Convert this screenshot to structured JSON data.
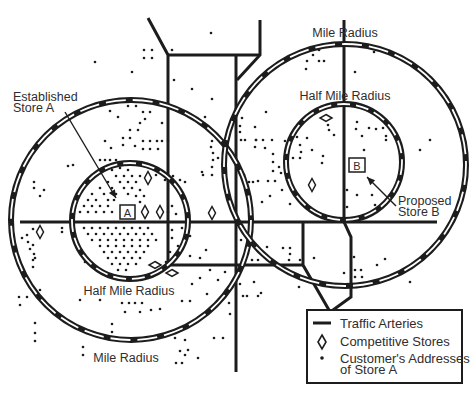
{
  "diagram": {
    "colors": {
      "ink": "#1c1c1c",
      "paper": "#ffffff",
      "text": "#2e2e2e"
    },
    "labels": {
      "mile_radius_top": "Mile Radius",
      "half_mile_radius_top": "Half Mile Radius",
      "established_line1": "Established",
      "established_line2": "Store A",
      "proposed_line1": "Proposed",
      "proposed_line2": "Store B",
      "half_mile_radius_bottom": "Half Mile Radius",
      "mile_radius_bottom": "Mile Radius",
      "store_a": "A",
      "store_b": "B"
    },
    "legend": {
      "traffic_arteries": "Traffic Arteries",
      "competitive_stores": "Competitive Stores",
      "customer_addresses_line1": "Customer's Addresses",
      "customer_addresses_line2": "of Store A"
    },
    "rings": [
      {
        "name": "store-a-mile-ring",
        "cx": 131,
        "cy": 220,
        "r": 120,
        "dash": "20 7"
      },
      {
        "name": "store-a-half-mile-ring",
        "cx": 130,
        "cy": 221,
        "r": 58,
        "dash": "13 6"
      },
      {
        "name": "store-b-mile-ring",
        "cx": 345,
        "cy": 165,
        "r": 121,
        "dash": "20 7"
      },
      {
        "name": "store-b-half-mile-ring",
        "cx": 344,
        "cy": 162,
        "r": 58,
        "dash": "13 6"
      }
    ],
    "roads": [
      [
        [
          148,
          18
        ],
        [
          168,
          55
        ],
        [
          168,
          265
        ]
      ],
      [
        [
          168,
          55
        ],
        [
          260,
          55
        ]
      ],
      [
        [
          260,
          20
        ],
        [
          260,
          55
        ],
        [
          237,
          80
        ]
      ],
      [
        [
          236,
          55
        ],
        [
          236,
          372
        ]
      ],
      [
        [
          344,
          20
        ],
        [
          344,
          222
        ],
        [
          351,
          237
        ],
        [
          351,
          297
        ],
        [
          333,
          310
        ]
      ],
      [
        [
          20,
          222
        ],
        [
          437,
          222
        ]
      ],
      [
        [
          168,
          265
        ],
        [
          303,
          265
        ]
      ],
      [
        [
          303,
          222
        ],
        [
          303,
          265
        ],
        [
          329,
          310
        ]
      ]
    ],
    "stores": [
      {
        "id": "A",
        "x": 120,
        "y": 205,
        "w": 15,
        "h": 14
      },
      {
        "id": "B",
        "x": 349,
        "y": 158,
        "w": 16,
        "h": 14
      }
    ],
    "arrows": [
      {
        "name": "store-a-arrow",
        "from": [
          65,
          112
        ],
        "to": [
          116,
          198
        ]
      },
      {
        "name": "store-b-arrow",
        "from": [
          396,
          206
        ],
        "to": [
          367,
          177
        ]
      }
    ],
    "competitive_stores": [
      {
        "x": 148,
        "y": 178,
        "orient": "v"
      },
      {
        "x": 145,
        "y": 212,
        "orient": "v"
      },
      {
        "x": 160,
        "y": 212,
        "orient": "v"
      },
      {
        "x": 40,
        "y": 232,
        "orient": "v"
      },
      {
        "x": 212,
        "y": 213,
        "orient": "v"
      },
      {
        "x": 312,
        "y": 185,
        "orient": "v"
      },
      {
        "x": 155,
        "y": 265,
        "orient": "h"
      },
      {
        "x": 172,
        "y": 273,
        "orient": "h"
      },
      {
        "x": 326,
        "y": 118,
        "orient": "h"
      }
    ],
    "customer_addresses": [
      [
        211,
        33
      ],
      [
        144,
        50
      ],
      [
        152,
        50
      ],
      [
        144,
        58
      ],
      [
        152,
        58
      ],
      [
        172,
        50
      ],
      [
        95,
        62
      ],
      [
        132,
        72
      ],
      [
        174,
        80
      ],
      [
        192,
        89
      ],
      [
        212,
        99
      ],
      [
        205,
        117
      ],
      [
        128,
        106
      ],
      [
        136,
        106
      ],
      [
        110,
        111
      ],
      [
        118,
        117
      ],
      [
        143,
        112
      ],
      [
        150,
        112
      ],
      [
        145,
        119
      ],
      [
        140,
        123
      ],
      [
        162,
        123
      ],
      [
        130,
        130
      ],
      [
        138,
        130
      ],
      [
        105,
        141
      ],
      [
        123,
        138
      ],
      [
        130,
        138
      ],
      [
        143,
        141
      ],
      [
        150,
        141
      ],
      [
        157,
        141
      ],
      [
        162,
        141
      ],
      [
        168,
        141
      ],
      [
        123,
        145
      ],
      [
        135,
        146
      ],
      [
        143,
        149
      ],
      [
        150,
        149
      ],
      [
        158,
        149
      ],
      [
        111,
        148
      ],
      [
        68,
        166
      ],
      [
        73,
        165
      ],
      [
        34,
        182
      ],
      [
        34,
        188
      ],
      [
        44,
        190
      ],
      [
        40,
        196
      ],
      [
        100,
        160
      ],
      [
        105,
        160
      ],
      [
        110,
        160
      ],
      [
        116,
        160
      ],
      [
        212,
        141
      ],
      [
        211,
        147
      ],
      [
        213,
        153
      ],
      [
        213,
        160
      ],
      [
        212,
        167
      ],
      [
        218,
        158
      ],
      [
        202,
        172
      ],
      [
        212,
        175
      ],
      [
        180,
        180
      ],
      [
        185,
        182
      ],
      [
        173,
        176
      ],
      [
        165,
        180
      ],
      [
        156,
        175
      ],
      [
        203,
        175
      ],
      [
        240,
        126
      ],
      [
        245,
        140
      ],
      [
        256,
        140
      ],
      [
        265,
        148
      ],
      [
        272,
        140
      ],
      [
        112,
        170
      ],
      [
        120,
        168
      ],
      [
        128,
        170
      ],
      [
        116,
        176
      ],
      [
        124,
        176
      ],
      [
        132,
        176
      ],
      [
        140,
        176
      ],
      [
        108,
        182
      ],
      [
        120,
        182
      ],
      [
        128,
        182
      ],
      [
        136,
        182
      ],
      [
        100,
        188
      ],
      [
        112,
        188
      ],
      [
        124,
        188
      ],
      [
        132,
        188
      ],
      [
        140,
        190
      ],
      [
        92,
        194
      ],
      [
        104,
        194
      ],
      [
        116,
        194
      ],
      [
        128,
        194
      ],
      [
        136,
        196
      ],
      [
        144,
        196
      ],
      [
        88,
        200
      ],
      [
        96,
        200
      ],
      [
        108,
        200
      ],
      [
        114,
        200
      ],
      [
        140,
        202
      ],
      [
        84,
        206
      ],
      [
        92,
        206
      ],
      [
        100,
        206
      ],
      [
        108,
        206
      ],
      [
        80,
        212
      ],
      [
        88,
        212
      ],
      [
        96,
        212
      ],
      [
        104,
        212
      ],
      [
        112,
        212
      ],
      [
        168,
        212
      ],
      [
        172,
        206
      ],
      [
        176,
        214
      ],
      [
        84,
        228
      ],
      [
        92,
        228
      ],
      [
        100,
        228
      ],
      [
        108,
        228
      ],
      [
        116,
        228
      ],
      [
        124,
        228
      ],
      [
        132,
        228
      ],
      [
        140,
        228
      ],
      [
        148,
        228
      ],
      [
        88,
        234
      ],
      [
        96,
        234
      ],
      [
        104,
        234
      ],
      [
        112,
        234
      ],
      [
        120,
        234
      ],
      [
        128,
        234
      ],
      [
        136,
        234
      ],
      [
        144,
        234
      ],
      [
        152,
        234
      ],
      [
        92,
        240
      ],
      [
        100,
        240
      ],
      [
        108,
        240
      ],
      [
        116,
        240
      ],
      [
        124,
        240
      ],
      [
        132,
        240
      ],
      [
        140,
        240
      ],
      [
        148,
        240
      ],
      [
        156,
        240
      ],
      [
        100,
        246
      ],
      [
        108,
        246
      ],
      [
        116,
        246
      ],
      [
        124,
        246
      ],
      [
        132,
        246
      ],
      [
        140,
        246
      ],
      [
        148,
        246
      ],
      [
        104,
        252
      ],
      [
        112,
        252
      ],
      [
        120,
        252
      ],
      [
        128,
        252
      ],
      [
        136,
        252
      ],
      [
        144,
        252
      ],
      [
        108,
        258
      ],
      [
        116,
        258
      ],
      [
        124,
        258
      ],
      [
        132,
        258
      ],
      [
        140,
        258
      ],
      [
        112,
        264
      ],
      [
        120,
        264
      ],
      [
        128,
        264
      ],
      [
        136,
        264
      ],
      [
        118,
        270
      ],
      [
        126,
        270
      ],
      [
        172,
        230
      ],
      [
        172,
        238
      ],
      [
        178,
        246
      ],
      [
        170,
        252
      ],
      [
        176,
        258
      ],
      [
        166,
        262
      ],
      [
        182,
        228
      ],
      [
        190,
        236
      ],
      [
        33,
        229
      ],
      [
        27,
        235
      ],
      [
        22,
        238
      ],
      [
        28,
        242
      ],
      [
        33,
        245
      ],
      [
        30,
        249
      ],
      [
        34,
        254
      ],
      [
        35,
        258
      ],
      [
        62,
        228
      ],
      [
        62,
        232
      ],
      [
        33,
        260
      ],
      [
        33,
        267
      ],
      [
        85,
        262
      ],
      [
        40,
        290
      ],
      [
        19,
        297
      ],
      [
        27,
        297
      ],
      [
        20,
        305
      ],
      [
        35,
        323
      ],
      [
        35,
        333
      ],
      [
        35,
        341
      ],
      [
        112,
        324
      ],
      [
        112,
        332
      ],
      [
        83,
        347
      ],
      [
        83,
        355
      ],
      [
        80,
        300
      ],
      [
        100,
        300
      ],
      [
        122,
        303
      ],
      [
        129,
        303
      ],
      [
        135,
        303
      ],
      [
        142,
        303
      ],
      [
        125,
        312
      ],
      [
        140,
        312
      ],
      [
        151,
        310
      ],
      [
        160,
        309
      ],
      [
        182,
        301
      ],
      [
        190,
        301
      ],
      [
        207,
        294
      ],
      [
        218,
        280
      ],
      [
        225,
        272
      ],
      [
        226,
        290
      ],
      [
        229,
        303
      ],
      [
        230,
        314
      ],
      [
        223,
        338
      ],
      [
        214,
        338
      ],
      [
        175,
        338
      ],
      [
        185,
        340
      ],
      [
        188,
        350
      ],
      [
        180,
        351
      ],
      [
        185,
        355
      ],
      [
        198,
        358
      ],
      [
        176,
        363
      ],
      [
        182,
        363
      ],
      [
        200,
        278
      ],
      [
        192,
        284
      ],
      [
        210,
        270
      ],
      [
        200,
        258
      ],
      [
        190,
        256
      ],
      [
        206,
        250
      ],
      [
        241,
        240
      ],
      [
        252,
        260
      ],
      [
        258,
        260
      ],
      [
        267,
        247
      ],
      [
        283,
        248
      ],
      [
        290,
        248
      ],
      [
        290,
        254
      ],
      [
        289,
        260
      ],
      [
        300,
        260
      ],
      [
        299,
        287
      ],
      [
        314,
        258
      ],
      [
        254,
        282
      ],
      [
        243,
        296
      ],
      [
        247,
        296
      ],
      [
        258,
        296
      ],
      [
        261,
        293
      ],
      [
        240,
        284
      ],
      [
        307,
        50
      ],
      [
        319,
        50
      ],
      [
        313,
        55
      ],
      [
        307,
        61
      ],
      [
        319,
        61
      ],
      [
        324,
        61
      ],
      [
        306,
        69
      ],
      [
        266,
        112
      ],
      [
        242,
        118
      ],
      [
        255,
        127
      ],
      [
        240,
        132
      ],
      [
        241,
        140
      ],
      [
        256,
        140
      ],
      [
        263,
        140
      ],
      [
        255,
        147
      ],
      [
        285,
        141
      ],
      [
        297,
        137
      ],
      [
        300,
        145
      ],
      [
        301,
        152
      ],
      [
        300,
        158
      ],
      [
        293,
        158
      ],
      [
        323,
        156
      ],
      [
        322,
        163
      ],
      [
        312,
        150
      ],
      [
        307,
        138
      ],
      [
        334,
        135
      ],
      [
        329,
        130
      ],
      [
        328,
        125
      ],
      [
        273,
        154
      ],
      [
        273,
        162
      ],
      [
        279,
        167
      ],
      [
        273,
        171
      ],
      [
        281,
        173
      ],
      [
        253,
        182
      ],
      [
        258,
        181
      ],
      [
        268,
        181
      ],
      [
        275,
        181
      ],
      [
        244,
        175
      ],
      [
        249,
        182
      ],
      [
        262,
        202
      ],
      [
        270,
        196
      ],
      [
        282,
        190
      ],
      [
        290,
        204
      ],
      [
        374,
        52
      ],
      [
        355,
        72
      ],
      [
        357,
        122
      ],
      [
        356,
        129
      ],
      [
        369,
        128
      ],
      [
        376,
        129
      ],
      [
        383,
        128
      ],
      [
        387,
        121
      ],
      [
        362,
        136
      ],
      [
        386,
        136
      ],
      [
        386,
        140
      ],
      [
        364,
        150
      ],
      [
        347,
        190
      ],
      [
        357,
        195
      ],
      [
        347,
        207
      ],
      [
        375,
        205
      ],
      [
        372,
        195
      ],
      [
        354,
        257
      ],
      [
        355,
        270
      ],
      [
        361,
        270
      ],
      [
        355,
        277
      ],
      [
        362,
        277
      ],
      [
        344,
        273
      ],
      [
        377,
        265
      ],
      [
        385,
        259
      ],
      [
        410,
        282
      ],
      [
        420,
        150
      ],
      [
        430,
        140
      ]
    ]
  }
}
